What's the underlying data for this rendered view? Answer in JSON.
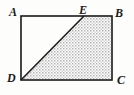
{
  "figure": {
    "shape_type": "rectangle-with-diagonal",
    "background_color": "#fdfdfc",
    "stroke_color": "#1a1a1a",
    "stroke_width": 1.6,
    "shade_fill_color": "#c9c9c9",
    "shade_pattern": "stipple-dots",
    "labels": {
      "A": "A",
      "B": "B",
      "C": "C",
      "D": "D",
      "E": "E"
    },
    "vertices": [
      {
        "name": "A",
        "x": 21,
        "y": 16,
        "label_position": "top-left-outside"
      },
      {
        "name": "B",
        "x": 112,
        "y": 16,
        "label_position": "top-right-outside"
      },
      {
        "name": "C",
        "x": 112,
        "y": 80,
        "label_position": "bottom-right-outside"
      },
      {
        "name": "D",
        "x": 21,
        "y": 80,
        "label_position": "bottom-left-outside"
      },
      {
        "name": "E",
        "x": 84,
        "y": 16,
        "label_position": "top-above-edge"
      }
    ],
    "segments": [
      {
        "name": "AB",
        "from": "A",
        "to": "B"
      },
      {
        "name": "BC",
        "from": "B",
        "to": "C"
      },
      {
        "name": "CD",
        "from": "C",
        "to": "D"
      },
      {
        "name": "DA",
        "from": "D",
        "to": "A"
      },
      {
        "name": "DE",
        "from": "D",
        "to": "E"
      }
    ],
    "shaded_region": {
      "name": "DEBC",
      "points": "21,80 84,16 112,16 112,80"
    }
  }
}
